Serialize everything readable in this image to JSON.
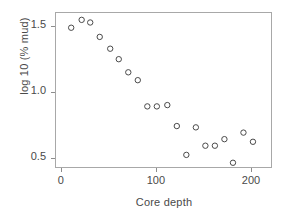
{
  "chart_data": {
    "type": "scatter",
    "title": "",
    "xlabel": "Core depth",
    "ylabel": "log 10 (% mud)",
    "xlim": [
      -6,
      222
    ],
    "ylim": [
      0.42,
      1.61
    ],
    "xticks": [
      0,
      100,
      200
    ],
    "xtick_labels": [
      "0",
      "100",
      "200"
    ],
    "yticks": [
      0.5,
      1.0,
      1.5
    ],
    "ytick_labels": [
      "0.5",
      "1.0",
      "1.5"
    ],
    "grid": false,
    "legend": "none",
    "marker": "open-circle",
    "marker_color": "#4a4a4a",
    "frame_color": "#a8a8a8",
    "points": [
      {
        "x": 11,
        "y": 1.49
      },
      {
        "x": 22,
        "y": 1.55
      },
      {
        "x": 31,
        "y": 1.53
      },
      {
        "x": 41,
        "y": 1.42
      },
      {
        "x": 52,
        "y": 1.33
      },
      {
        "x": 61,
        "y": 1.25
      },
      {
        "x": 71,
        "y": 1.15
      },
      {
        "x": 81,
        "y": 1.09
      },
      {
        "x": 91,
        "y": 0.89
      },
      {
        "x": 101,
        "y": 0.89
      },
      {
        "x": 112,
        "y": 0.9
      },
      {
        "x": 122,
        "y": 0.74
      },
      {
        "x": 132,
        "y": 0.52
      },
      {
        "x": 142,
        "y": 0.73
      },
      {
        "x": 152,
        "y": 0.59
      },
      {
        "x": 162,
        "y": 0.59
      },
      {
        "x": 172,
        "y": 0.64
      },
      {
        "x": 181,
        "y": 0.46
      },
      {
        "x": 192,
        "y": 0.69
      },
      {
        "x": 202,
        "y": 0.62
      }
    ]
  },
  "axes": {
    "x_title": "Core depth",
    "y_title": "log 10 (% mud)"
  }
}
